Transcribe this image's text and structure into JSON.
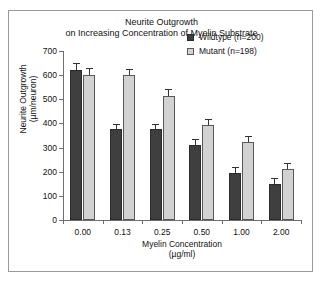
{
  "chart_data": {
    "type": "bar",
    "title": "Neurite Outgrowth on Increasing Concentration of Myelin Substrate",
    "title_line1": "Neurite Outgrowth",
    "title_line2": "on Increasing Concentration of Myelin Substrate",
    "xlabel": "Myelin Concentration (µg/ml)",
    "xlabel_line1": "Myelin Concentration",
    "xlabel_line2": "(µg/ml)",
    "ylabel": "Neurite Outgrowth (µm/neuron)",
    "ylabel_line1": "Neurite Outgrowth",
    "ylabel_line2": "(µm/neuron)",
    "categories": [
      "0.00",
      "0.13",
      "0.25",
      "0.50",
      "1.00",
      "2.00"
    ],
    "ylim": [
      0,
      700
    ],
    "yticks": [
      0,
      100,
      200,
      300,
      400,
      500,
      600,
      700
    ],
    "ytick_labels": [
      "0",
      "100",
      "200",
      "300",
      "400",
      "500",
      "600",
      "700"
    ],
    "grid": false,
    "legend_position": "top-right",
    "series": [
      {
        "name": "Wildtype (n=200)",
        "key": "wildtype",
        "color": "#3f3f3f",
        "values": [
          620,
          375,
          375,
          310,
          195,
          150
        ],
        "errors": [
          28,
          20,
          20,
          20,
          22,
          18
        ]
      },
      {
        "name": "Mutant (n=198)",
        "key": "mutant",
        "color": "#d2d2d2",
        "values": [
          600,
          600,
          515,
          395,
          325,
          210
        ],
        "errors": [
          25,
          22,
          22,
          20,
          20,
          20
        ]
      }
    ]
  },
  "legend": {
    "items": [
      {
        "label": "Wildtype (n=200)",
        "swatch": "wildtype"
      },
      {
        "label": "Mutant (n=198)",
        "swatch": "mutant"
      }
    ]
  },
  "colors": {
    "wildtype_fill": "#3f3f3f",
    "mutant_fill": "#d2d2d2",
    "axis": "#6e6e6e",
    "frame": "#9a9a9a",
    "text": "#111111"
  }
}
